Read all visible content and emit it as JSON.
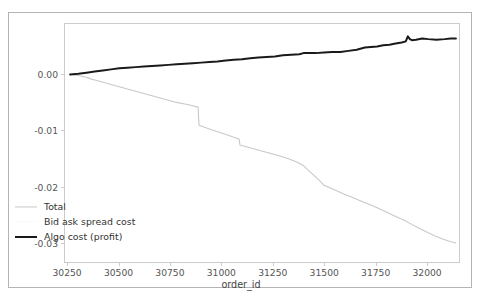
{
  "chart_data": {
    "type": "line",
    "title": "",
    "xlabel": "order_id",
    "ylabel": "",
    "xlim": [
      30235,
      32160
    ],
    "ylim": [
      -0.0335,
      0.009
    ],
    "grid": false,
    "legend_position": "lower left",
    "xticks": [
      30250,
      30500,
      30750,
      31000,
      31250,
      31500,
      31750,
      32000
    ],
    "xtick_labels": [
      "30250",
      "30500",
      "30750",
      "31000",
      "31250",
      "31500",
      "31750",
      "32000"
    ],
    "yticks": [
      0.0,
      -0.01,
      -0.02,
      -0.03
    ],
    "ytick_labels": [
      "0.00",
      "-0.01",
      "-0.02",
      "-0.03"
    ],
    "series": [
      {
        "name": "Total",
        "color": "#c8c8c8",
        "linewidth": 1.1,
        "x": [
          30260,
          30300,
          30340,
          30360,
          30390,
          30420,
          30460,
          30500,
          30540,
          30580,
          30620,
          30660,
          30700,
          30740,
          30780,
          30820,
          30860,
          30880,
          30885,
          30890,
          30930,
          30970,
          31010,
          31050,
          31080,
          31085,
          31090,
          31130,
          31170,
          31210,
          31250,
          31290,
          31330,
          31370,
          31400,
          31420,
          31450,
          31480,
          31500,
          31520,
          31540,
          31570,
          31600,
          31640,
          31680,
          31720,
          31760,
          31800,
          31840,
          31870,
          31890,
          31920,
          31960,
          32000,
          32040,
          32080,
          32120,
          32145
        ],
        "y": [
          0.0,
          -0.0002,
          -0.0005,
          -0.0008,
          -0.0011,
          -0.0014,
          -0.0018,
          -0.0022,
          -0.0026,
          -0.003,
          -0.0034,
          -0.0038,
          -0.0042,
          -0.0046,
          -0.005,
          -0.0053,
          -0.0056,
          -0.0058,
          -0.0058,
          -0.0091,
          -0.0096,
          -0.0101,
          -0.0106,
          -0.0111,
          -0.0115,
          -0.0115,
          -0.0126,
          -0.013,
          -0.0134,
          -0.0138,
          -0.0142,
          -0.0146,
          -0.0151,
          -0.0157,
          -0.0163,
          -0.017,
          -0.018,
          -0.019,
          -0.0198,
          -0.0201,
          -0.0204,
          -0.0209,
          -0.0214,
          -0.022,
          -0.0226,
          -0.0232,
          -0.0238,
          -0.0245,
          -0.0252,
          -0.0257,
          -0.026,
          -0.0266,
          -0.0274,
          -0.0281,
          -0.0288,
          -0.0294,
          -0.0299,
          -0.0301
        ]
      },
      {
        "name": "Bid ask spread cost",
        "color": "#fafafa",
        "linewidth": 1.1,
        "x": [],
        "y": []
      },
      {
        "name": "Algo cost (profit)",
        "color": "#1a1a1a",
        "linewidth": 2.0,
        "x": [
          30260,
          30300,
          30340,
          30380,
          30420,
          30460,
          30500,
          30540,
          30580,
          30620,
          30660,
          30700,
          30740,
          30780,
          30820,
          30860,
          30900,
          30940,
          30980,
          31020,
          31060,
          31100,
          31140,
          31180,
          31220,
          31260,
          31300,
          31340,
          31380,
          31400,
          31420,
          31460,
          31500,
          31540,
          31580,
          31620,
          31660,
          31700,
          31730,
          31760,
          31790,
          31820,
          31850,
          31880,
          31900,
          31910,
          31920,
          31930,
          31950,
          31980,
          32010,
          32050,
          32090,
          32120,
          32145
        ],
        "y": [
          0.0,
          0.0001,
          0.0003,
          0.0005,
          0.0007,
          0.0009,
          0.0011,
          0.0012,
          0.0013,
          0.0014,
          0.0015,
          0.0016,
          0.0017,
          0.0018,
          0.0019,
          0.002,
          0.0021,
          0.0022,
          0.0023,
          0.0025,
          0.0026,
          0.0027,
          0.0029,
          0.003,
          0.0031,
          0.0032,
          0.0034,
          0.0035,
          0.0036,
          0.0038,
          0.0038,
          0.0038,
          0.0039,
          0.004,
          0.004,
          0.0042,
          0.0044,
          0.0048,
          0.0049,
          0.005,
          0.0052,
          0.0053,
          0.0055,
          0.0057,
          0.0059,
          0.0068,
          0.0063,
          0.0061,
          0.0062,
          0.0064,
          0.0063,
          0.0062,
          0.0063,
          0.0064,
          0.0064
        ]
      }
    ]
  }
}
